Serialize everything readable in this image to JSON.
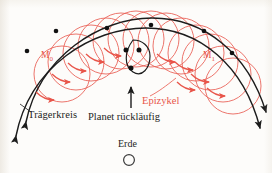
{
  "figure": {
    "title_text": null,
    "language": "de",
    "background_color": "#fdfcfa",
    "deferent_color": "#1c1c1c",
    "epicycle_color": "#e8554a",
    "marker_color": "#111111"
  },
  "labels": {
    "traegerkreis": "Trägerkreis",
    "planet_ruecklaeufig": "Planet rückläufig",
    "epizykel": "Epizykel",
    "erde": "Erde",
    "m0_letter": "M",
    "m0_sub": "0",
    "m1_letter": "M",
    "m1_sub": "1"
  },
  "diagram_data": {
    "type": "geometric-diagram",
    "description": "Ptolemaic epicycle construction showing retrograde planetary motion",
    "deferent_arcs": [
      {
        "name": "deferent-arc-upper",
        "path": "M 22,128 C 40,52 100,16 152,16 C 205,16 248,52 268,118",
        "arrow_start": "down-left",
        "arrow_end": "up-right"
      },
      {
        "name": "deferent-arc-lower",
        "path": "M 12,140 C 30,62 92,26 146,26 C 200,26 244,62 262,132",
        "arrow_start": "down-left",
        "arrow_end": "up-right"
      }
    ],
    "epicycle_circles": {
      "count": 13,
      "radius": 28,
      "center_path_note": "centers follow the deferent arc"
    },
    "planet_markers": {
      "count": 12,
      "note": "black dots marking successive planet positions; three cluster around the retrograde loop at center"
    },
    "retrograde_loop": {
      "location": "center",
      "note": "small closed loop where the planet appears to move backwards"
    },
    "direction_arrows": {
      "epicycle_arrows": 10,
      "orientation": "down-right",
      "color": "#e8554a"
    },
    "earth": {
      "symbol": "open circle",
      "position": "below center"
    }
  }
}
